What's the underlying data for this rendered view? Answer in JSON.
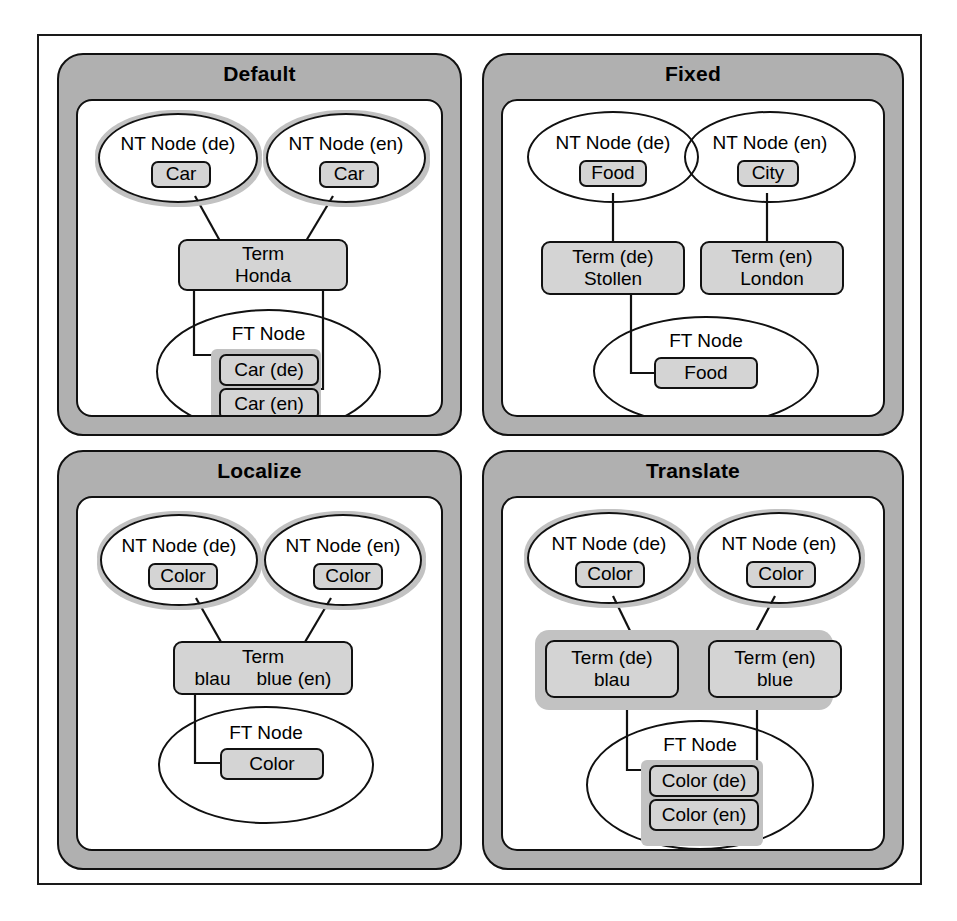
{
  "figure": {
    "colors": {
      "panel_band": "#b0b0b0",
      "box_fill": "#d4d4d4",
      "highlight": "#c2c2c2",
      "stroke": "#111111",
      "background": "#ffffff"
    }
  },
  "panels": [
    {
      "id": "default",
      "title": "Default",
      "nt_left": {
        "label": "NT Node (de)",
        "box": "Car"
      },
      "nt_right": {
        "label": "NT Node (en)",
        "box": "Car"
      },
      "term": {
        "line1": "Term",
        "line2": "Honda"
      },
      "ft": {
        "label": "FT Node",
        "boxes": [
          "Car (de)",
          "Car (en)"
        ]
      }
    },
    {
      "id": "fixed",
      "title": "Fixed",
      "nt_left": {
        "label": "NT Node (de)",
        "box": "Food"
      },
      "nt_right": {
        "label": "NT Node (en)",
        "box": "City"
      },
      "term_left": {
        "line1": "Term (de)",
        "line2": "Stollen"
      },
      "term_right": {
        "line1": "Term (en)",
        "line2": "London"
      },
      "ft": {
        "label": "FT Node",
        "boxes": [
          "Food"
        ]
      }
    },
    {
      "id": "localize",
      "title": "Localize",
      "nt_left": {
        "label": "NT Node (de)",
        "box": "Color"
      },
      "nt_right": {
        "label": "NT Node (en)",
        "box": "Color"
      },
      "term": {
        "line1": "Term",
        "line2_a": "blau",
        "line2_b": "blue (en)"
      },
      "ft": {
        "label": "FT Node",
        "boxes": [
          "Color"
        ]
      }
    },
    {
      "id": "translate",
      "title": "Translate",
      "nt_left": {
        "label": "NT Node (de)",
        "box": "Color"
      },
      "nt_right": {
        "label": "NT Node (en)",
        "box": "Color"
      },
      "term_left": {
        "line1": "Term (de)",
        "line2": "blau"
      },
      "term_right": {
        "line1": "Term (en)",
        "line2": "blue"
      },
      "ft": {
        "label": "FT Node",
        "boxes": [
          "Color (de)",
          "Color (en)"
        ]
      }
    }
  ]
}
